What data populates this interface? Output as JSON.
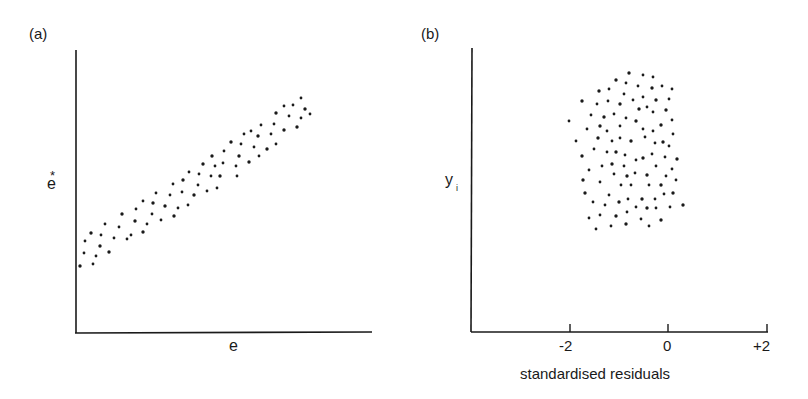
{
  "figure": {
    "panel_a_label": "(a)",
    "panel_b_label": "(b)",
    "ink_color": "#1a1a1a",
    "background": "#ffffff"
  },
  "panel_a": {
    "xlabel": "e",
    "ylabel": "e",
    "ylabel_superscript": "*"
  },
  "panel_b": {
    "xlabel": "standardised residuals",
    "ylabel": "y",
    "ylabel_subscript": "i",
    "ticks": [
      {
        "label": "-2",
        "value": -2
      },
      {
        "label": "0",
        "value": 0
      },
      {
        "label": "+2",
        "value": 2
      }
    ]
  },
  "chart_data": [
    {
      "type": "scatter",
      "title": "(a)",
      "xlabel": "e",
      "ylabel": "e*",
      "grid": false,
      "legend": null,
      "note": "Positively correlated band of points; no tick values shown. Coordinates in pixel space of original figure (x right, y down).",
      "points_px": [
        [
          80,
          266
        ],
        [
          84,
          253
        ],
        [
          85,
          241
        ],
        [
          91,
          233
        ],
        [
          93,
          264
        ],
        [
          96,
          256
        ],
        [
          100,
          246
        ],
        [
          101,
          235
        ],
        [
          105,
          224
        ],
        [
          109,
          252
        ],
        [
          114,
          238
        ],
        [
          119,
          227
        ],
        [
          122,
          214
        ],
        [
          127,
          239
        ],
        [
          131,
          235
        ],
        [
          135,
          221
        ],
        [
          136,
          209
        ],
        [
          143,
          201
        ],
        [
          143,
          232
        ],
        [
          147,
          224
        ],
        [
          152,
          214
        ],
        [
          153,
          203
        ],
        [
          156,
          193
        ],
        [
          161,
          220
        ],
        [
          165,
          206
        ],
        [
          170,
          195
        ],
        [
          173,
          184
        ],
        [
          174,
          216
        ],
        [
          178,
          208
        ],
        [
          182,
          192
        ],
        [
          183,
          180
        ],
        [
          188,
          205
        ],
        [
          189,
          172
        ],
        [
          194,
          195
        ],
        [
          198,
          185
        ],
        [
          199,
          174
        ],
        [
          203,
          164
        ],
        [
          207,
          191
        ],
        [
          211,
          176
        ],
        [
          212,
          156
        ],
        [
          215,
          166
        ],
        [
          217,
          188
        ],
        [
          220,
          176
        ],
        [
          223,
          163
        ],
        [
          224,
          151
        ],
        [
          231,
          142
        ],
        [
          236,
          166
        ],
        [
          237,
          176
        ],
        [
          239,
          156
        ],
        [
          241,
          144
        ],
        [
          244,
          134
        ],
        [
          249,
          162
        ],
        [
          251,
          131
        ],
        [
          254,
          147
        ],
        [
          258,
          136
        ],
        [
          259,
          156
        ],
        [
          261,
          125
        ],
        [
          267,
          149
        ],
        [
          271,
          134
        ],
        [
          274,
          124
        ],
        [
          276,
          113
        ],
        [
          276,
          144
        ],
        [
          284,
          106
        ],
        [
          284,
          130
        ],
        [
          289,
          116
        ],
        [
          293,
          105
        ],
        [
          297,
          127
        ],
        [
          301,
          98
        ],
        [
          301,
          118
        ],
        [
          305,
          109
        ],
        [
          310,
          114
        ]
      ]
    },
    {
      "type": "scatter",
      "title": "(b)",
      "xlabel": "standardised residuals",
      "ylabel": "y_i",
      "xlim": [
        -4,
        2
      ],
      "xticks": [
        -2,
        0,
        2
      ],
      "xtick_labels": [
        "-2",
        "0",
        "+2"
      ],
      "grid": false,
      "legend": null,
      "note": "Cloud of points concentrated between roughly -2 and +0.3 standardised residuals. Coordinates in pixel space (x right, y down); x pixel 570 = -2, 668 = 0, 768 = +2.",
      "points_px": [
        [
          629,
          73
        ],
        [
          643,
          75
        ],
        [
          653,
          77
        ],
        [
          616,
          80
        ],
        [
          626,
          83
        ],
        [
          638,
          86
        ],
        [
          652,
          88
        ],
        [
          662,
          86
        ],
        [
          672,
          89
        ],
        [
          599,
          91
        ],
        [
          609,
          89
        ],
        [
          624,
          94
        ],
        [
          582,
          101
        ],
        [
          597,
          104
        ],
        [
          608,
          101
        ],
        [
          620,
          104
        ],
        [
          633,
          100
        ],
        [
          643,
          97
        ],
        [
          656,
          100
        ],
        [
          669,
          99
        ],
        [
          591,
          115
        ],
        [
          604,
          117
        ],
        [
          614,
          114
        ],
        [
          626,
          118
        ],
        [
          639,
          109
        ],
        [
          647,
          107
        ],
        [
          653,
          112
        ],
        [
          666,
          110
        ],
        [
          569,
          121
        ],
        [
          587,
          129
        ],
        [
          600,
          126
        ],
        [
          607,
          131
        ],
        [
          620,
          126
        ],
        [
          636,
          121
        ],
        [
          643,
          129
        ],
        [
          653,
          131
        ],
        [
          661,
          125
        ],
        [
          672,
          120
        ],
        [
          576,
          141
        ],
        [
          598,
          138
        ],
        [
          612,
          141
        ],
        [
          620,
          138
        ],
        [
          631,
          141
        ],
        [
          645,
          137
        ],
        [
          655,
          143
        ],
        [
          663,
          142
        ],
        [
          669,
          146
        ],
        [
          673,
          134
        ],
        [
          582,
          156
        ],
        [
          594,
          149
        ],
        [
          607,
          152
        ],
        [
          616,
          152
        ],
        [
          625,
          155
        ],
        [
          636,
          160
        ],
        [
          643,
          158
        ],
        [
          652,
          154
        ],
        [
          665,
          157
        ],
        [
          677,
          159
        ],
        [
          589,
          170
        ],
        [
          602,
          166
        ],
        [
          612,
          164
        ],
        [
          624,
          166
        ],
        [
          635,
          173
        ],
        [
          647,
          175
        ],
        [
          656,
          166
        ],
        [
          672,
          169
        ],
        [
          583,
          180
        ],
        [
          600,
          182
        ],
        [
          614,
          174
        ],
        [
          627,
          176
        ],
        [
          631,
          185
        ],
        [
          649,
          185
        ],
        [
          661,
          185
        ],
        [
          666,
          176
        ],
        [
          676,
          180
        ],
        [
          585,
          193
        ],
        [
          609,
          195
        ],
        [
          621,
          185
        ],
        [
          642,
          199
        ],
        [
          655,
          199
        ],
        [
          664,
          194
        ],
        [
          673,
          193
        ],
        [
          593,
          202
        ],
        [
          605,
          205
        ],
        [
          619,
          202
        ],
        [
          628,
          199
        ],
        [
          636,
          207
        ],
        [
          647,
          208
        ],
        [
          656,
          208
        ],
        [
          670,
          207
        ],
        [
          683,
          205
        ],
        [
          589,
          218
        ],
        [
          600,
          215
        ],
        [
          616,
          216
        ],
        [
          627,
          212
        ],
        [
          641,
          219
        ],
        [
          661,
          220
        ],
        [
          596,
          229
        ],
        [
          611,
          226
        ],
        [
          626,
          224
        ],
        [
          649,
          226
        ]
      ]
    }
  ]
}
